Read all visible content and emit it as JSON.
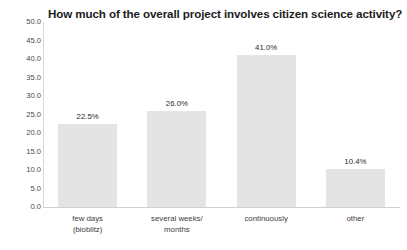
{
  "chart_data": {
    "type": "bar",
    "title": "How much of the overall project involves citizen science activity?",
    "xlabel": "",
    "ylabel": "",
    "categories": [
      "few days\n(bioblitz)",
      "several weeks/\nmonths",
      "continuously",
      "other"
    ],
    "category_lines": [
      [
        "few days",
        "(bioblitz)"
      ],
      [
        "several weeks/",
        "months"
      ],
      [
        "continuously",
        ""
      ],
      [
        "other",
        ""
      ]
    ],
    "values": [
      22.5,
      26.0,
      41.0,
      10.4
    ],
    "data_labels": [
      "22.5%",
      "26.0%",
      "41.0%",
      "10.4%"
    ],
    "ylim": [
      0,
      50
    ],
    "ytick_values": [
      0,
      5,
      10,
      15,
      20,
      25,
      30,
      35,
      40,
      45,
      50
    ],
    "ytick_labels": [
      "0.0",
      "5.0",
      "10.0",
      "15.0",
      "20.0",
      "25.0",
      "30.0",
      "35.0",
      "40.0",
      "45.0",
      "50.0"
    ],
    "grid": false,
    "legend": null,
    "bar_color": "#e4e4e4",
    "title_color": "#1c1c1c",
    "axis_color": "#d0d0d0",
    "tick_label_color": "#4a4a4a"
  }
}
